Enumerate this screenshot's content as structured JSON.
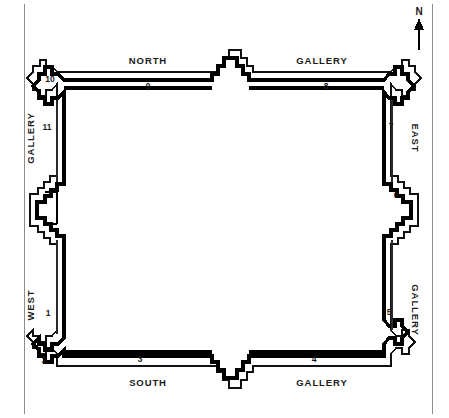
{
  "diagram": {
    "type": "architectural-floor-plan",
    "frame": {
      "visible": true,
      "color": "#8c8c8c"
    }
  },
  "compass": {
    "label": "N",
    "direction": "up",
    "icon": "north-arrow-icon"
  },
  "gallery_labels": [
    {
      "id": "north-left",
      "text": "NORTH",
      "x": 148,
      "y": 60,
      "rotation": 0
    },
    {
      "id": "north-right",
      "text": "GALLERY",
      "x": 322,
      "y": 60,
      "rotation": 0
    },
    {
      "id": "south-left",
      "text": "SOUTH",
      "x": 148,
      "y": 382,
      "rotation": 0
    },
    {
      "id": "south-right",
      "text": "GALLERY",
      "x": 322,
      "y": 382,
      "rotation": 0
    },
    {
      "id": "west-upper",
      "text": "GALLERY",
      "x": 30,
      "y": 138,
      "rotation": -90
    },
    {
      "id": "west-lower",
      "text": "WEST",
      "x": 30,
      "y": 305,
      "rotation": -90
    },
    {
      "id": "east-upper",
      "text": "EAST",
      "x": 415,
      "y": 138,
      "rotation": 90
    },
    {
      "id": "east-lower",
      "text": "GALLERY",
      "x": 415,
      "y": 310,
      "rotation": 90
    }
  ],
  "wall_numbers": [
    {
      "n": "1",
      "x": 48,
      "y": 313,
      "wall": "west"
    },
    {
      "n": "2",
      "x": 44,
      "y": 360,
      "wall": "southwest-corner"
    },
    {
      "n": "3",
      "x": 140,
      "y": 359,
      "wall": "south"
    },
    {
      "n": "4",
      "x": 314,
      "y": 359,
      "wall": "south"
    },
    {
      "n": "5",
      "x": 389,
      "y": 312,
      "wall": "east"
    },
    {
      "n": "6",
      "x": 396,
      "y": 195,
      "wall": "east"
    },
    {
      "n": "7",
      "x": 391,
      "y": 126,
      "wall": "east"
    },
    {
      "n": "8",
      "x": 326,
      "y": 86,
      "wall": "north"
    },
    {
      "n": "9",
      "x": 148,
      "y": 86,
      "wall": "north"
    },
    {
      "n": "10",
      "x": 50,
      "y": 79,
      "wall": "northwest-corner"
    },
    {
      "n": "11",
      "x": 47,
      "y": 127,
      "wall": "west"
    }
  ]
}
